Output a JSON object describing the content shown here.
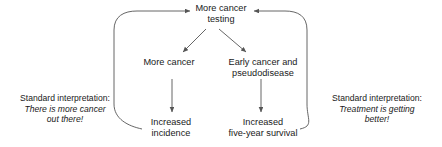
{
  "diagram": {
    "line_color": "#555555",
    "text_color": "#1a1a1a",
    "background": "#ffffff",
    "nodes": {
      "testing": "More cancer\ntesting",
      "more_cancer": "More cancer",
      "early_cancer": "Early cancer and\npseudodisease",
      "incidence": "Increased\nincidence",
      "survival": "Increased\nfive-year survival"
    },
    "captions": {
      "left": {
        "lead": "Standard interpretation:",
        "quote": "There is more cancer\nout there!"
      },
      "right": {
        "lead": "Standard interpretation:",
        "quote": "Treatment is getting\nbetter!"
      }
    },
    "edges": [
      {
        "from": "testing",
        "to": "more_cancer",
        "style": "straight-arrow"
      },
      {
        "from": "testing",
        "to": "early_cancer",
        "style": "straight-arrow"
      },
      {
        "from": "more_cancer",
        "to": "incidence",
        "style": "straight-arrow"
      },
      {
        "from": "early_cancer",
        "to": "survival",
        "style": "straight-arrow"
      },
      {
        "from": "incidence",
        "to": "testing",
        "style": "curved-feedback-left"
      },
      {
        "from": "survival",
        "to": "testing",
        "style": "curved-feedback-right"
      }
    ]
  }
}
